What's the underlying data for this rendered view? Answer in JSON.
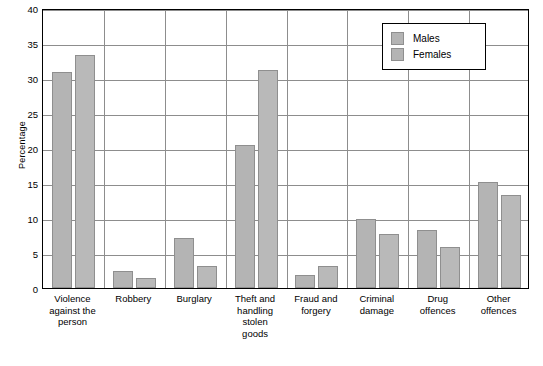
{
  "chart_data": {
    "type": "bar",
    "title": "",
    "xlabel": "",
    "ylabel": "Percentage",
    "ylim": [
      0,
      40
    ],
    "ytick_step": 5,
    "yticks": [
      "0",
      "5",
      "10",
      "15",
      "20",
      "25",
      "30",
      "35",
      "40"
    ],
    "grid": true,
    "legend_position": "top-right",
    "categories": [
      "Violence\nagainst the\nperson",
      "Robbery",
      "Burglary",
      "Theft and\nhandling\nstolen\ngoods",
      "Fraud and\nforgery",
      "Criminal\ndamage",
      "Drug\noffences",
      "Other\noffences"
    ],
    "series": [
      {
        "name": "Males",
        "color": "#b4b4b4",
        "values": [
          30.9,
          2.4,
          7.2,
          20.4,
          1.9,
          9.9,
          8.3,
          15.1
        ]
      },
      {
        "name": "Females",
        "color": "#b9b9b9",
        "values": [
          33.3,
          1.5,
          3.1,
          31.2,
          3.2,
          7.7,
          5.9,
          13.3
        ]
      }
    ]
  },
  "legend": {
    "items": [
      {
        "label": "Males"
      },
      {
        "label": "Females"
      }
    ]
  },
  "axis": {
    "y_title": "Percentage"
  }
}
